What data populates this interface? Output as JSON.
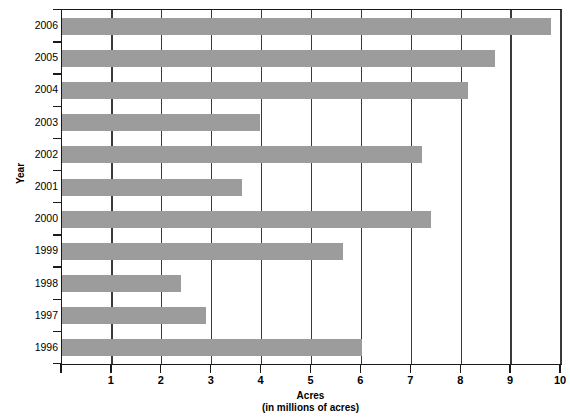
{
  "chart_data": {
    "type": "bar",
    "orientation": "horizontal",
    "title": "",
    "xlabel": "Acres",
    "xlabel_sub": "(in millions of acres)",
    "ylabel": "Year",
    "categories": [
      "2006",
      "2005",
      "2004",
      "2003",
      "2002",
      "2001",
      "2000",
      "1999",
      "1998",
      "1997",
      "1996"
    ],
    "values": [
      9.8,
      8.68,
      8.14,
      3.96,
      7.22,
      3.6,
      7.4,
      5.64,
      2.38,
      2.88,
      6.02
    ],
    "xlim": [
      0,
      10
    ],
    "xticks": [
      "1",
      "2",
      "3",
      "4",
      "5",
      "6",
      "7",
      "8",
      "9",
      "10"
    ],
    "xtick_values": [
      1,
      2,
      3,
      4,
      5,
      6,
      7,
      8,
      9,
      10
    ],
    "grid": "vertical",
    "legend": "none",
    "bar_color": "#9c9c9c",
    "axis_color": "#1a1a1a"
  },
  "axes": {
    "y_title": "Year",
    "x_title_line1": "Acres",
    "x_title_line2": "(in millions of acres)"
  }
}
